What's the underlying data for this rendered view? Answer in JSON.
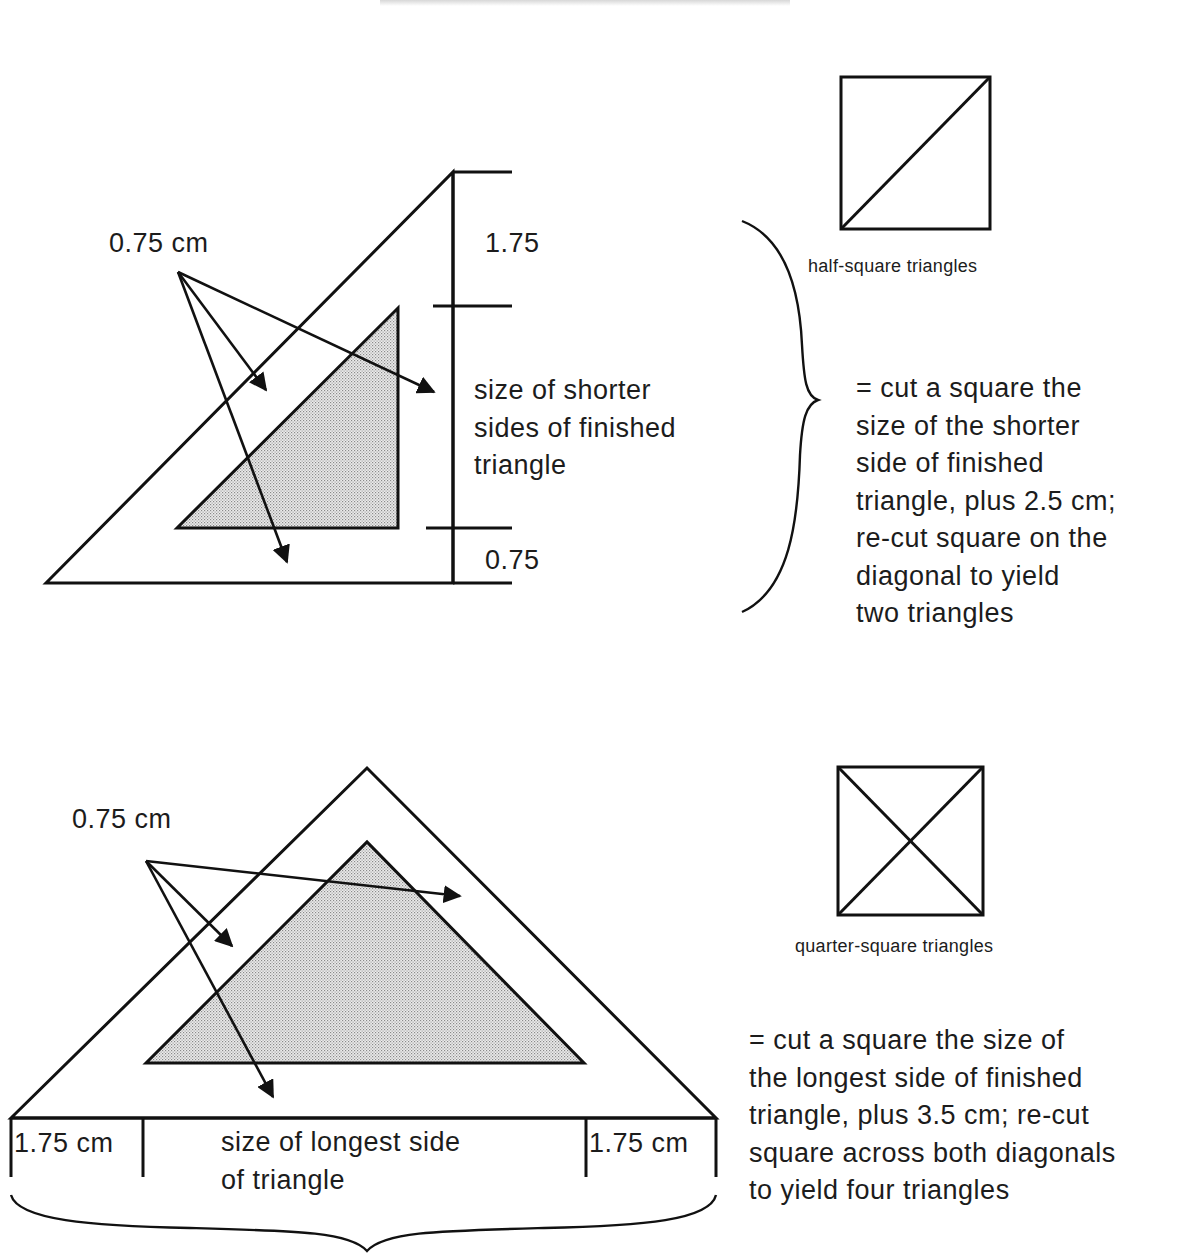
{
  "page": {
    "background": "#ffffff",
    "ink_color": "#1a1a1a",
    "fill_color": "#d4d4d4"
  },
  "section_half_square": {
    "arrow_label": "0.75 cm",
    "dim_top": "1.75",
    "dim_middle_lines": [
      "size of shorter",
      "sides of finished",
      "triangle"
    ],
    "dim_bottom": "0.75",
    "icon_caption": "half-square triangles",
    "instruction_lines": [
      "= cut a square the",
      "size of the shorter",
      "side of finished",
      "triangle, plus 2.5 cm;",
      "re-cut square on the",
      "diagonal to yield",
      "two triangles"
    ]
  },
  "section_quarter_square": {
    "arrow_label": "0.75 cm",
    "dim_left": "1.75 cm",
    "dim_middle_lines": [
      "size of longest side",
      "of triangle"
    ],
    "dim_right": "1.75 cm",
    "icon_caption": "quarter-square triangles",
    "instruction_lines": [
      "= cut a square the size of",
      "the longest side of finished",
      "triangle, plus 3.5 cm; re-cut",
      "square across both diagonals",
      "to yield four triangles"
    ]
  }
}
